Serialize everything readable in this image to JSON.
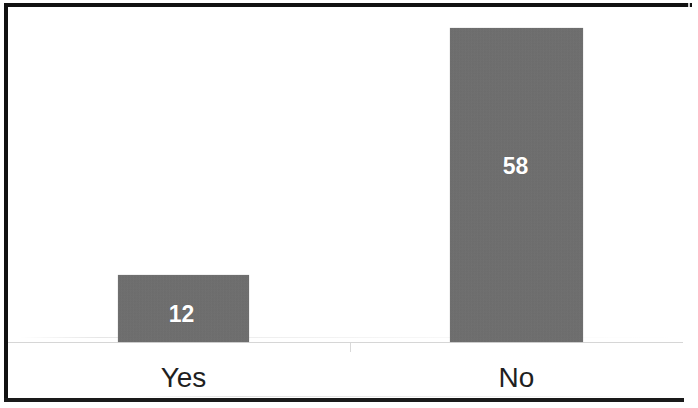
{
  "figure": {
    "background_color": "#ffffff",
    "frame_color": "#111111",
    "bar_color": "#6e6e6e",
    "value_label_color": "#ffffff",
    "category_label_color": "#1f1f1f",
    "axis_line_color": "#d6d6d6"
  },
  "chart_data": {
    "type": "bar",
    "title": "",
    "subtitle": "",
    "xlabel": "",
    "ylabel": "",
    "categories": [
      "Yes",
      "No"
    ],
    "values": [
      12,
      58
    ],
    "data_labels": [
      "12",
      "58"
    ],
    "data_labels_position": "inside-upper",
    "ylim": [
      0,
      68
    ],
    "grid": false,
    "legend": false,
    "legend_position": "none",
    "orientation": "vertical",
    "axis_tick_labels_y": [],
    "series": [
      {
        "name": "Responses",
        "values": [
          12,
          58
        ]
      }
    ]
  }
}
